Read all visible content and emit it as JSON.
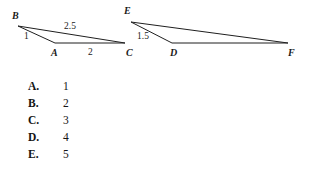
{
  "figure": {
    "stroke_color": "#1f1f1f",
    "background_color": "#ffffff",
    "triangles": [
      {
        "name": "triangle-abc",
        "vertices": [
          {
            "label": "B",
            "x": 18,
            "y": 26,
            "label_x": 12,
            "label_y": 11
          },
          {
            "label": "A",
            "x": 55,
            "y": 43,
            "label_x": 51,
            "label_y": 48
          },
          {
            "label": "C",
            "x": 125,
            "y": 43,
            "label_x": 126,
            "label_y": 48
          }
        ],
        "side_labels": [
          {
            "text": "1",
            "x": 24,
            "y": 31
          },
          {
            "text": "2.5",
            "x": 64,
            "y": 21
          },
          {
            "text": "2",
            "x": 88,
            "y": 47
          }
        ]
      },
      {
        "name": "triangle-def",
        "vertices": [
          {
            "label": "E",
            "x": 131,
            "y": 22,
            "label_x": 124,
            "label_y": 6
          },
          {
            "label": "D",
            "x": 172,
            "y": 43,
            "label_x": 170,
            "label_y": 48
          },
          {
            "label": "F",
            "x": 288,
            "y": 43,
            "label_x": 288,
            "label_y": 48
          }
        ],
        "side_labels": [
          {
            "text": "1.5",
            "x": 137,
            "y": 31
          }
        ]
      }
    ]
  },
  "choices": [
    {
      "letter": "A.",
      "value": "1"
    },
    {
      "letter": "B.",
      "value": "2"
    },
    {
      "letter": "C.",
      "value": "3"
    },
    {
      "letter": "D.",
      "value": "4"
    },
    {
      "letter": "E.",
      "value": "5"
    }
  ]
}
